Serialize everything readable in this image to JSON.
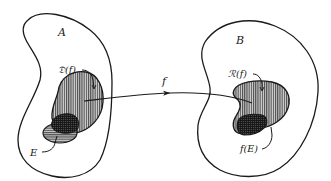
{
  "diagram": {
    "type": "function-mapping",
    "colors": {
      "ink": "#1a1a1a",
      "background": "#ffffff",
      "hatch_fill": "#bdbdbd",
      "dark_fill": "#3a3a3a"
    },
    "sets": {
      "domain_set": {
        "label": "A"
      },
      "codomain_set": {
        "label": "B"
      }
    },
    "regions": {
      "domain_of_f": {
        "label": "𝔇(f)",
        "pattern": "vertical-hatch"
      },
      "subset_E": {
        "label": "E",
        "pattern": "horizontal-hatch"
      },
      "range_of_f": {
        "label": "ℛ(f)",
        "pattern": "vertical-hatch"
      },
      "image_f_E": {
        "label": "f(E)",
        "pattern": "cross-hatch"
      }
    },
    "arrow": {
      "label": "f",
      "from": "domain_of_f",
      "to": "range_of_f"
    }
  }
}
